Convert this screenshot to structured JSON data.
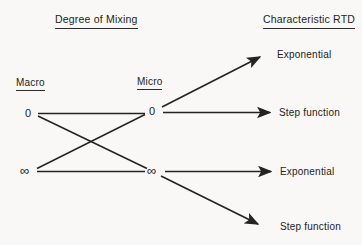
{
  "page": {
    "background": "#f9f8f6",
    "ink": "#232323"
  },
  "diagram": {
    "title_left": "Degree of Mixing",
    "title_right": "Characteristic RTD",
    "macro_label": "Macro",
    "micro_label": "Micro",
    "nodes": {
      "macro_zero": "0",
      "macro_infinity": "∞",
      "micro_zero": "0",
      "micro_infinity": "∞"
    },
    "rtd": {
      "top": "Exponential",
      "upper_mid": "Step function",
      "lower_mid": "Exponential",
      "bottom": "Step function"
    },
    "edges": [
      {
        "from": "macro 0",
        "to": "micro 0",
        "arrowhead": false
      },
      {
        "from": "macro 0",
        "to": "micro ∞",
        "arrowhead": false
      },
      {
        "from": "macro ∞",
        "to": "micro 0",
        "arrowhead": false
      },
      {
        "from": "macro ∞",
        "to": "micro ∞",
        "arrowhead": false
      },
      {
        "from": "micro 0",
        "to": "Exponential (top)",
        "arrowhead": true
      },
      {
        "from": "micro 0",
        "to": "Step function (upper)",
        "arrowhead": true
      },
      {
        "from": "micro ∞",
        "to": "Exponential (lower)",
        "arrowhead": true
      },
      {
        "from": "micro ∞",
        "to": "Step function (bottom)",
        "arrowhead": true
      }
    ]
  }
}
